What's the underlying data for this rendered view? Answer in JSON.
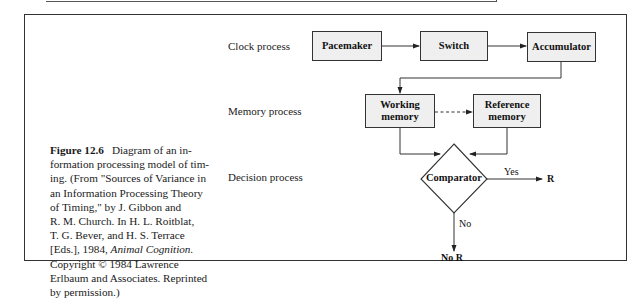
{
  "figure": {
    "number_label": "Figure 12.6",
    "caption_lines": [
      "Diagram of an in-",
      "formation processing model of tim-",
      "ing. (From \"Sources of Variance in",
      "an Information Processing Theory",
      "of Timing,\" by J. Gibbon and",
      "R. M. Church. In H. L. Roitblat,",
      "T. G. Bever, and H. S. Terrace",
      "[Eds.], 1984, ",
      "Animal Cognition.",
      "Copyright © 1984 Lawrence",
      "Erlbaum and Associates. Reprinted",
      "by permission.)"
    ]
  },
  "diagram": {
    "process_labels": {
      "clock": "Clock process",
      "memory": "Memory process",
      "decision": "Decision process"
    },
    "nodes": {
      "pacemaker": "Pacemaker",
      "switch": "Switch",
      "accumulator": "Accumulator",
      "working_memory": [
        "Working",
        "memory"
      ],
      "reference_memory": [
        "Reference",
        "memory"
      ],
      "comparator": "Comparator"
    },
    "edge_labels": {
      "yes": "Yes",
      "r": "R",
      "no": "No",
      "no_r": "No R"
    },
    "edges": [
      {
        "from": "Pacemaker",
        "to": "Switch",
        "style": "solid"
      },
      {
        "from": "Switch",
        "to": "Accumulator",
        "style": "solid"
      },
      {
        "from": "Accumulator",
        "to": "Working memory",
        "style": "solid"
      },
      {
        "from": "Working memory",
        "to": "Reference memory",
        "style": "dashed"
      },
      {
        "from": "Working memory",
        "to": "Comparator",
        "style": "solid"
      },
      {
        "from": "Reference memory",
        "to": "Comparator",
        "style": "solid"
      },
      {
        "from": "Comparator",
        "to": "R",
        "label": "Yes",
        "style": "solid"
      },
      {
        "from": "Comparator",
        "to": "No R",
        "label": "No",
        "style": "solid"
      }
    ],
    "colors": {
      "box_fill": "#efefef",
      "line": "#333333"
    }
  }
}
